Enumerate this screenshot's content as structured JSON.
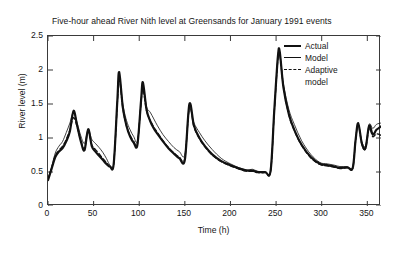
{
  "chart_data": {
    "type": "line",
    "title": "Five-hour ahead River Nith level at Greensands for January 1991 events",
    "xlabel": "Time (h)",
    "ylabel": "River level (m)",
    "xlim": [
      0,
      365
    ],
    "ylim": [
      0,
      2.5
    ],
    "xticks": [
      0,
      50,
      100,
      150,
      200,
      250,
      300,
      350
    ],
    "yticks": [
      0,
      0.5,
      1,
      1.5,
      2,
      2.5
    ],
    "grid": false,
    "legend_position": "top-right",
    "legend": [
      "Actual",
      "Model",
      "Adaptive model"
    ],
    "colors": {
      "actual": "#111111",
      "model": "#111111",
      "adaptive": "#111111"
    },
    "x": [
      0,
      4,
      8,
      12,
      16,
      20,
      24,
      28,
      32,
      36,
      40,
      44,
      48,
      52,
      56,
      60,
      64,
      68,
      72,
      76,
      78,
      82,
      86,
      90,
      94,
      98,
      102,
      104,
      108,
      112,
      116,
      120,
      126,
      132,
      138,
      144,
      150,
      155,
      160,
      166,
      172,
      180,
      190,
      200,
      210,
      218,
      224,
      230,
      238,
      244,
      248,
      252,
      254,
      258,
      264,
      270,
      278,
      288,
      298,
      306,
      314,
      320,
      328,
      334,
      337,
      340,
      344,
      348,
      352,
      356,
      360,
      365
    ],
    "series": [
      {
        "name": "Actual",
        "style": "solid-thick",
        "values": [
          0.38,
          0.55,
          0.72,
          0.8,
          0.85,
          0.95,
          1.1,
          1.4,
          1.18,
          0.95,
          0.82,
          1.13,
          0.88,
          0.8,
          0.74,
          0.68,
          0.62,
          0.58,
          0.62,
          1.55,
          1.97,
          1.45,
          1.18,
          1.02,
          0.93,
          0.9,
          1.55,
          1.82,
          1.42,
          1.25,
          1.14,
          1.06,
          0.95,
          0.85,
          0.77,
          0.7,
          0.68,
          1.5,
          1.18,
          1.0,
          0.88,
          0.76,
          0.66,
          0.6,
          0.55,
          0.52,
          0.52,
          0.5,
          0.5,
          0.52,
          1.4,
          2.2,
          2.27,
          1.75,
          1.35,
          1.12,
          0.9,
          0.72,
          0.62,
          0.6,
          0.58,
          0.56,
          0.57,
          0.56,
          0.95,
          1.22,
          0.92,
          0.85,
          1.18,
          1.05,
          1.12,
          1.17
        ]
      },
      {
        "name": "Model",
        "style": "solid-thin",
        "values": [
          0.4,
          0.58,
          0.78,
          0.88,
          0.95,
          1.08,
          1.22,
          1.38,
          1.22,
          1.03,
          0.92,
          1.12,
          0.98,
          0.92,
          0.86,
          0.79,
          0.7,
          0.6,
          0.62,
          1.5,
          1.92,
          1.5,
          1.26,
          1.12,
          1.02,
          0.96,
          1.5,
          1.78,
          1.46,
          1.38,
          1.28,
          1.18,
          1.05,
          0.95,
          0.86,
          0.8,
          0.76,
          1.42,
          1.22,
          1.08,
          0.96,
          0.83,
          0.7,
          0.62,
          0.56,
          0.53,
          0.54,
          0.51,
          0.5,
          0.52,
          1.38,
          2.18,
          2.25,
          1.8,
          1.42,
          1.2,
          0.96,
          0.76,
          0.64,
          0.62,
          0.6,
          0.58,
          0.58,
          0.57,
          0.96,
          1.2,
          0.95,
          0.88,
          1.2,
          1.14,
          1.2,
          1.22
        ]
      },
      {
        "name": "Adaptive model",
        "style": "dashed",
        "values": [
          0.39,
          0.56,
          0.74,
          0.82,
          0.88,
          0.98,
          1.12,
          1.3,
          1.16,
          0.96,
          0.84,
          1.1,
          0.9,
          0.83,
          0.77,
          0.7,
          0.64,
          0.58,
          0.62,
          1.52,
          1.88,
          1.44,
          1.18,
          1.04,
          0.95,
          0.91,
          1.52,
          1.72,
          1.4,
          1.26,
          1.16,
          1.08,
          0.96,
          0.86,
          0.78,
          0.72,
          0.7,
          1.46,
          1.16,
          0.99,
          0.87,
          0.75,
          0.65,
          0.59,
          0.54,
          0.51,
          0.51,
          0.49,
          0.49,
          0.51,
          1.38,
          2.16,
          2.24,
          1.76,
          1.34,
          1.11,
          0.89,
          0.71,
          0.61,
          0.59,
          0.57,
          0.55,
          0.56,
          0.55,
          0.94,
          1.2,
          0.91,
          0.84,
          1.14,
          1.02,
          1.06,
          1.04
        ]
      }
    ]
  }
}
